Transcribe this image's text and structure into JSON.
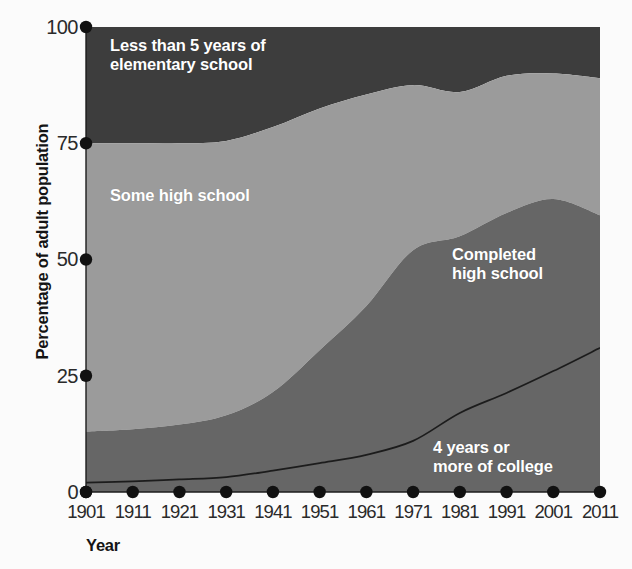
{
  "chart_data": {
    "type": "area",
    "title": "",
    "subtitle": "",
    "xlabel": "Year",
    "ylabel": "Percentage of adult population",
    "stacked": true,
    "grid": false,
    "legend_position": "in-plot-labels",
    "xlim": [
      1901,
      2011
    ],
    "ylim": [
      0,
      100
    ],
    "xticks": [
      "1901",
      "1911",
      "1921",
      "1931",
      "1941",
      "1951",
      "1961",
      "1971",
      "1981",
      "1991",
      "2001",
      "2011"
    ],
    "yticks": [
      "0",
      "25",
      "50",
      "75",
      "100"
    ],
    "x": [
      1901,
      1911,
      1921,
      1931,
      1941,
      1951,
      1961,
      1971,
      1981,
      1991,
      2001,
      2011
    ],
    "series": [
      {
        "name": "4 years or more of college",
        "color": "#666666",
        "values": [
          2,
          2.3,
          2.7,
          3.2,
          4.6,
          6.2,
          8.0,
          11.0,
          17.0,
          21.3,
          26.0,
          31.0
        ]
      },
      {
        "name": "Completed high school",
        "color": "#666666",
        "values": [
          11.0,
          11.2,
          11.8,
          13.3,
          16.9,
          24.3,
          32.0,
          41.0,
          38.0,
          38.7,
          37.0,
          28.5
        ]
      },
      {
        "name": "Some high school",
        "color": "#9b9b9b",
        "values": [
          62.0,
          61.5,
          60.5,
          59.0,
          57.0,
          52.0,
          45.5,
          35.5,
          31.0,
          29.5,
          27.0,
          29.5
        ]
      },
      {
        "name": "Less than 5 years of elementary school",
        "color": "#3d3d3d",
        "values": [
          25.0,
          25.0,
          25.0,
          24.5,
          21.5,
          17.5,
          14.5,
          12.5,
          14.0,
          10.5,
          10.0,
          11.0
        ]
      }
    ],
    "cumulative_boundaries": {
      "note": "upper edge of each stacked band, percent of adult population",
      "college_line": [
        2,
        2.3,
        2.7,
        3.2,
        4.6,
        6.2,
        8.0,
        11.0,
        17.0,
        21.3,
        26.0,
        31.0
      ],
      "completed_high_school_top": [
        13.0,
        13.5,
        14.5,
        16.5,
        21.5,
        30.5,
        40.0,
        52.0,
        55.0,
        60.0,
        63.0,
        59.5
      ],
      "some_high_school_top": [
        75.0,
        75.0,
        75.0,
        75.5,
        78.5,
        82.5,
        85.5,
        87.5,
        86.0,
        89.5,
        90.0,
        89.0
      ],
      "total_top": [
        100,
        100,
        100,
        100,
        100,
        100,
        100,
        100,
        100,
        100,
        100,
        100
      ]
    },
    "band_labels": [
      {
        "name": "less-than-5-years-elementary",
        "text": "Less than 5 years of\nelementary school",
        "x": 110,
        "y": 36
      },
      {
        "name": "some-high-school",
        "text": "Some high school",
        "x": 110,
        "y": 186
      },
      {
        "name": "completed-high-school",
        "text": "Completed\nhigh school",
        "x": 452,
        "y": 245
      },
      {
        "name": "four-years-or-more-college",
        "text": "4 years or\nmore of college",
        "x": 433,
        "y": 438
      }
    ],
    "colors": {
      "elementary": "#3d3d3d",
      "some_high_school": "#9b9b9b",
      "completed_high_school": "#666666",
      "college_band": "#666666",
      "college_line": "#1c1c1c",
      "tick_marker": "#111111",
      "axis_text": "#2a2a2a",
      "label_text": "#141414",
      "band_label_text": "#ffffff",
      "background": "#fbfbfb"
    }
  }
}
